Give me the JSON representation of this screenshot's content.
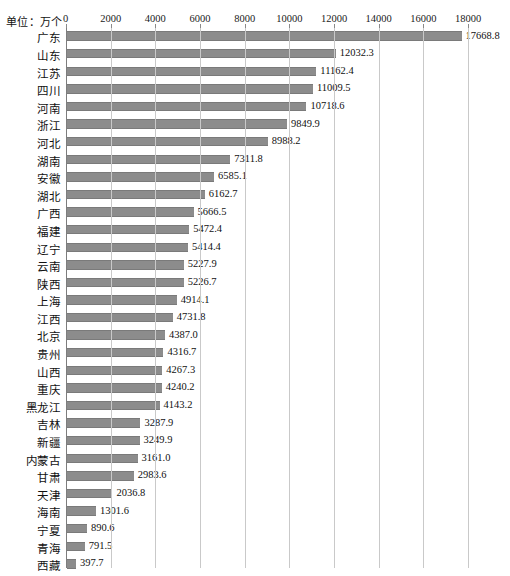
{
  "unit_label": "单位：万个",
  "axis": {
    "ticks": [
      0,
      2000,
      4000,
      6000,
      8000,
      10000,
      12000,
      14000,
      16000,
      18000
    ],
    "min": 0,
    "max": 18000
  },
  "colors": {
    "bar": "#8c8c8c",
    "grid": "#c9c9c9",
    "axis": "#7d7d7d",
    "text": "#111111",
    "background": "#ffffff"
  },
  "chart_data": {
    "type": "bar",
    "orientation": "horizontal",
    "title": "",
    "subtitle": "",
    "xlabel": "",
    "ylabel": "",
    "unit": "万个",
    "xlim": [
      0,
      18000
    ],
    "grid": true,
    "legend": "none",
    "sorted": "descending",
    "categories": [
      "广东",
      "山东",
      "江苏",
      "四川",
      "河南",
      "浙江",
      "河北",
      "湖南",
      "安徽",
      "湖北",
      "广西",
      "福建",
      "辽宁",
      "云南",
      "陕西",
      "上海",
      "江西",
      "北京",
      "贵州",
      "山西",
      "重庆",
      "黑龙江",
      "吉林",
      "新疆",
      "内蒙古",
      "甘肃",
      "天津",
      "海南",
      "宁夏",
      "青海",
      "西藏"
    ],
    "values": [
      17668.8,
      12032.3,
      11162.4,
      11009.5,
      10718.6,
      9849.9,
      8988.2,
      7311.8,
      6585.1,
      6162.7,
      5666.5,
      5472.4,
      5414.4,
      5227.9,
      5226.7,
      4914.1,
      4731.8,
      4387.0,
      4316.7,
      4267.3,
      4240.2,
      4143.2,
      3287.9,
      3249.9,
      3161.0,
      2983.6,
      2036.8,
      1301.6,
      890.6,
      791.5,
      397.7
    ],
    "value_labels": [
      "17668.8",
      "12032.3",
      "11162.4",
      "11009.5",
      "10718.6",
      "9849.9",
      "8988.2",
      "7311.8",
      "6585.1",
      "6162.7",
      "5666.5",
      "5472.4",
      "5414.4",
      "5227.9",
      "5226.7",
      "4914.1",
      "4731.8",
      "4387.0",
      "4316.7",
      "4267.3",
      "4240.2",
      "4143.2",
      "3287.9",
      "3249.9",
      "3161.0",
      "2983.6",
      "2036.8",
      "1301.6",
      "890.6",
      "791.5",
      "397.7"
    ]
  }
}
